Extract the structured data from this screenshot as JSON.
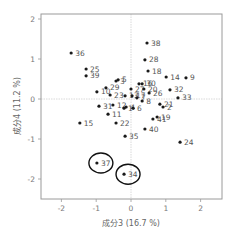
{
  "chart_data": {
    "type": "scatter",
    "title": "",
    "xlabel": "成分3 (16.7 %)",
    "ylabel": "成分4 (11.2 %)",
    "xlim": [
      -2.5,
      2.6
    ],
    "ylim": [
      -2.6,
      2.15
    ],
    "xticks": [
      -2,
      -1,
      0,
      1,
      2
    ],
    "yticks": [
      2,
      1,
      0,
      -1,
      -2
    ],
    "grid": false,
    "zero_lines": true,
    "legend": "none",
    "points": [
      {
        "label": "36",
        "x": -1.72,
        "y": 1.15
      },
      {
        "label": "25",
        "x": -1.29,
        "y": 0.75
      },
      {
        "label": "39",
        "x": -1.29,
        "y": 0.58
      },
      {
        "label": "38",
        "x": 0.46,
        "y": 1.4
      },
      {
        "label": "28",
        "x": 0.4,
        "y": 0.98
      },
      {
        "label": "18",
        "x": 0.49,
        "y": 0.7
      },
      {
        "label": "14",
        "x": 1.01,
        "y": 0.55
      },
      {
        "label": "9",
        "x": 1.58,
        "y": 0.53
      },
      {
        "label": "3",
        "x": -0.43,
        "y": 0.45
      },
      {
        "label": "5",
        "x": -0.37,
        "y": 0.48
      },
      {
        "label": "29",
        "x": -0.72,
        "y": 0.28
      },
      {
        "label": "10",
        "x": -0.98,
        "y": 0.18
      },
      {
        "label": "23",
        "x": -0.6,
        "y": 0.1
      },
      {
        "label": "27",
        "x": 0.0,
        "y": 0.25
      },
      {
        "label": "13",
        "x": -0.17,
        "y": 0.08
      },
      {
        "label": "17",
        "x": 0.03,
        "y": 0.08
      },
      {
        "label": "16",
        "x": 0.23,
        "y": 0.38
      },
      {
        "label": "30",
        "x": 0.32,
        "y": 0.38
      },
      {
        "label": "20",
        "x": 0.37,
        "y": 0.25
      },
      {
        "label": "26",
        "x": 0.52,
        "y": 0.15
      },
      {
        "label": "32",
        "x": 1.12,
        "y": 0.23
      },
      {
        "label": "33",
        "x": 1.35,
        "y": 0.03
      },
      {
        "label": "7",
        "x": 0.17,
        "y": 0.03
      },
      {
        "label": "8",
        "x": 0.32,
        "y": -0.05
      },
      {
        "label": "21",
        "x": 0.83,
        "y": -0.13
      },
      {
        "label": "2",
        "x": 0.92,
        "y": -0.2
      },
      {
        "label": "31",
        "x": -0.92,
        "y": -0.18
      },
      {
        "label": "12",
        "x": -0.52,
        "y": -0.15
      },
      {
        "label": "1",
        "x": -0.2,
        "y": -0.23
      },
      {
        "label": "4",
        "x": -0.14,
        "y": -0.2
      },
      {
        "label": "6",
        "x": 0.06,
        "y": -0.23
      },
      {
        "label": "11",
        "x": -0.66,
        "y": -0.38
      },
      {
        "label": "22",
        "x": -0.43,
        "y": -0.6
      },
      {
        "label": "15",
        "x": -1.47,
        "y": -0.6
      },
      {
        "label": "19",
        "x": 0.75,
        "y": -0.45
      },
      {
        "label": "41",
        "x": 0.63,
        "y": -0.5
      },
      {
        "label": "40",
        "x": 0.4,
        "y": -0.75
      },
      {
        "label": "35",
        "x": -0.17,
        "y": -0.93
      },
      {
        "label": "24",
        "x": 1.41,
        "y": -1.08
      },
      {
        "label": "37",
        "x": -0.98,
        "y": -1.6
      },
      {
        "label": "34",
        "x": -0.2,
        "y": -1.88
      }
    ],
    "highlighted": [
      "37",
      "34"
    ]
  },
  "layout": {
    "plot": {
      "left": 41,
      "top": 14,
      "right": 222,
      "bottom": 199
    },
    "x0_px": 131,
    "x_unit_px": 34.8,
    "y0_px": 99,
    "y_unit_px": 40
  },
  "colors": {
    "frame": "#9a9a9a",
    "zero_line": "#cfcfcf",
    "point": "#1a1a1a",
    "highlight_ring": "#111111"
  }
}
